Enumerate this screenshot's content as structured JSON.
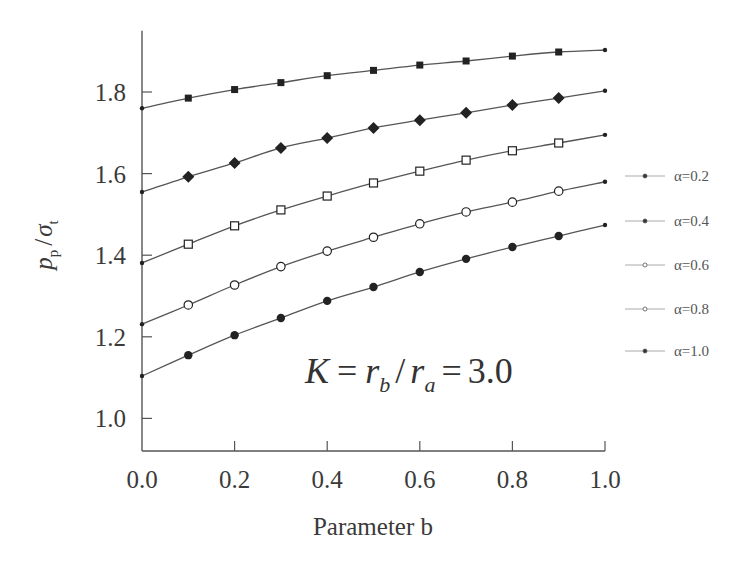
{
  "chart_data": {
    "type": "line",
    "title": "",
    "xlabel": "Parameter b",
    "ylabel": "p_p / σ_t",
    "ylabel_parts": {
      "main1": "p",
      "sub1": "p",
      "slash": "/",
      "main2": "σ",
      "sub2": "t"
    },
    "xlim": [
      0.0,
      1.0
    ],
    "ylim": [
      0.92,
      1.95
    ],
    "x_ticks": [
      0.0,
      0.2,
      0.4,
      0.6,
      0.8,
      1.0
    ],
    "x_tick_labels": [
      "0.0",
      "0.2",
      "0.4",
      "0.6",
      "0.8",
      "1.0"
    ],
    "y_ticks": [
      1.0,
      1.2,
      1.4,
      1.6,
      1.8
    ],
    "y_tick_labels": [
      "1.0",
      "1.2",
      "1.4",
      "1.6",
      "1.8"
    ],
    "grid": false,
    "legend_position": "right",
    "x": [
      0.0,
      0.1,
      0.2,
      0.3,
      0.4,
      0.5,
      0.6,
      0.7,
      0.8,
      0.9,
      1.0
    ],
    "series": [
      {
        "name": "α=0.2",
        "marker": "filled-square",
        "values": [
          1.76,
          1.785,
          1.806,
          1.823,
          1.84,
          1.853,
          1.866,
          1.876,
          1.888,
          1.898,
          1.903
        ]
      },
      {
        "name": "α=0.4",
        "marker": "filled-diamond",
        "values": [
          1.555,
          1.592,
          1.626,
          1.663,
          1.687,
          1.712,
          1.731,
          1.749,
          1.768,
          1.785,
          1.803
        ]
      },
      {
        "name": "α=0.6",
        "marker": "open-square",
        "values": [
          1.381,
          1.427,
          1.472,
          1.511,
          1.545,
          1.577,
          1.606,
          1.633,
          1.656,
          1.675,
          1.695
        ]
      },
      {
        "name": "α=0.8",
        "marker": "open-circle",
        "values": [
          1.231,
          1.278,
          1.327,
          1.372,
          1.41,
          1.444,
          1.477,
          1.506,
          1.53,
          1.557,
          1.58
        ]
      },
      {
        "name": "α=1.0",
        "marker": "filled-circle",
        "values": [
          1.104,
          1.155,
          1.204,
          1.246,
          1.288,
          1.322,
          1.359,
          1.391,
          1.42,
          1.447,
          1.474
        ]
      }
    ],
    "annotations": [
      {
        "text": "K = r_b / r_a = 3.0",
        "parts": {
          "K": "K",
          "eq1": "=",
          "r1": "r",
          "sub_b": "b",
          "slash": "/",
          "r2": "r",
          "sub_a": "a",
          "eq2": "=",
          "val": "3.0"
        }
      }
    ]
  },
  "colors": {
    "line": "#555555",
    "marker": "#222222",
    "axis": "#555555",
    "background": "#ffffff"
  }
}
